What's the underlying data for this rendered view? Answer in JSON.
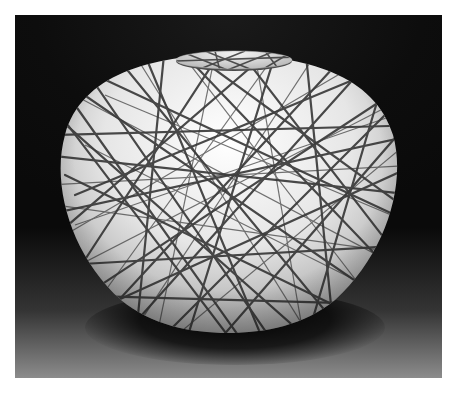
{
  "image": {
    "subject": "Round ceramic vase with a short lid-like mouth, covered in a dense web of dark crisscrossing lines over a white glaze",
    "background": "Dark studio backdrop fading to gray floor with a shadow beneath the vase",
    "colors": {
      "frame": "#ffffff",
      "backdrop": "#0d0d0d",
      "floor": "#8c8c8c",
      "glaze": "#f2f2f2",
      "lines": "#2a2a2a"
    }
  }
}
